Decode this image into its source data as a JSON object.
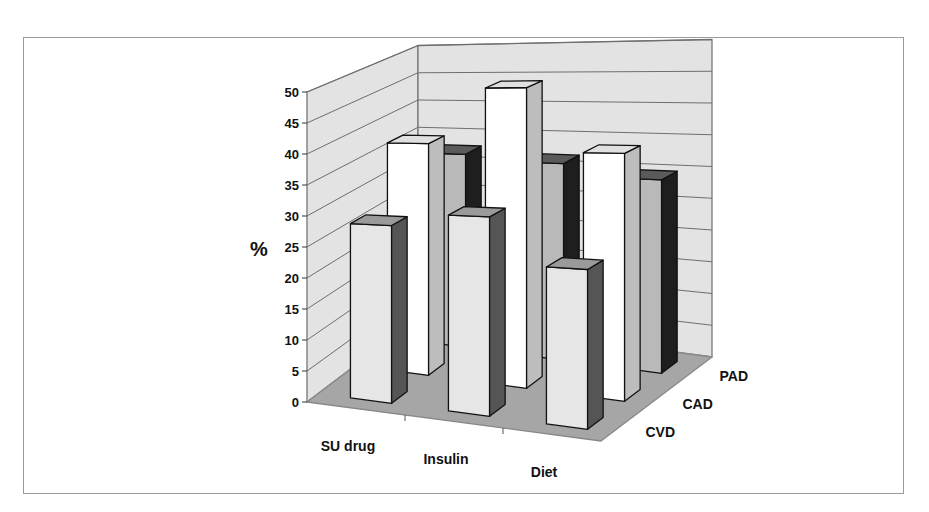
{
  "chart_data": {
    "type": "bar",
    "subtype": "3d-column",
    "title": "",
    "xlabel": "",
    "ylabel": "%",
    "ylim": [
      0,
      50
    ],
    "yticks": [
      0,
      5,
      10,
      15,
      20,
      25,
      30,
      35,
      40,
      45,
      50
    ],
    "categories": [
      "SU drug",
      "Insulin",
      "Diet"
    ],
    "series": [
      {
        "name": "CVD",
        "values": [
          28,
          30,
          23
        ]
      },
      {
        "name": "CAD",
        "values": [
          38,
          47,
          37
        ]
      },
      {
        "name": "PAD",
        "values": [
          33,
          32,
          30
        ]
      }
    ],
    "depth_labels": [
      "CVD",
      "CAD",
      "PAD"
    ],
    "grid": true,
    "legend": "none (series shown on depth axis)"
  },
  "colors": {
    "CVD_front": "#e6e6e6",
    "CVD_side": "#555555",
    "CVD_top": "#9a9a9a",
    "CAD_front": "#ffffff",
    "CAD_side": "#bdbdbd",
    "CAD_top": "#e0e0e0",
    "PAD_front": "#b9b9b9",
    "PAD_side": "#1e1e1e",
    "PAD_top": "#5a5a5a",
    "wall": "#e3e3e3",
    "floor": "#a6a6a6",
    "gridline": "#6e6e6e",
    "frame": "#9a9a9a"
  },
  "axis": {
    "y_title": "%"
  }
}
